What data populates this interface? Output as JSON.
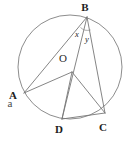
{
  "figure": {
    "background_color": "#ffffff",
    "stroke_color": "#777777",
    "circle_stroke_color": "#8d8d8d",
    "label_color": "#1d1d1d"
  },
  "circle": {
    "center_x": 70,
    "center_y": 67,
    "radius": 52,
    "center_point_label": "O",
    "center_point_x": 72,
    "center_point_y": 72
  },
  "points": [
    {
      "id": "B",
      "label": "B",
      "x": 87,
      "y": 17,
      "label_x": 85,
      "label_y": 11
    },
    {
      "id": "A",
      "label": "A",
      "x": 24,
      "y": 93,
      "label_x": 13,
      "label_y": 99
    },
    {
      "id": "D",
      "label": "D",
      "x": 62,
      "y": 119,
      "label_x": 59,
      "label_y": 133
    },
    {
      "id": "C",
      "label": "C",
      "x": 105,
      "y": 113,
      "label_x": 103,
      "label_y": 131
    }
  ],
  "segments": [
    {
      "name": "chord-BA",
      "from": "B",
      "to": "A"
    },
    {
      "name": "chord-BD",
      "from": "B",
      "to": "D"
    },
    {
      "name": "chord-BC",
      "from": "B",
      "to": "C"
    },
    {
      "name": "chord-DC",
      "from": "D",
      "to": "C"
    },
    {
      "name": "radius-OA",
      "from": "O",
      "to": "A"
    },
    {
      "name": "radius-OC",
      "from": "O",
      "to": "C"
    }
  ],
  "angles": [
    {
      "name": "angle-x",
      "label": "x",
      "vertex": "B",
      "label_x": 77,
      "label_y": 37
    },
    {
      "name": "angle-y",
      "label": "y",
      "vertex": "B",
      "label_x": 87,
      "label_y": 42
    }
  ],
  "annotations": [
    {
      "name": "item-letter",
      "label": "a",
      "x": 10,
      "y": 107
    }
  ]
}
